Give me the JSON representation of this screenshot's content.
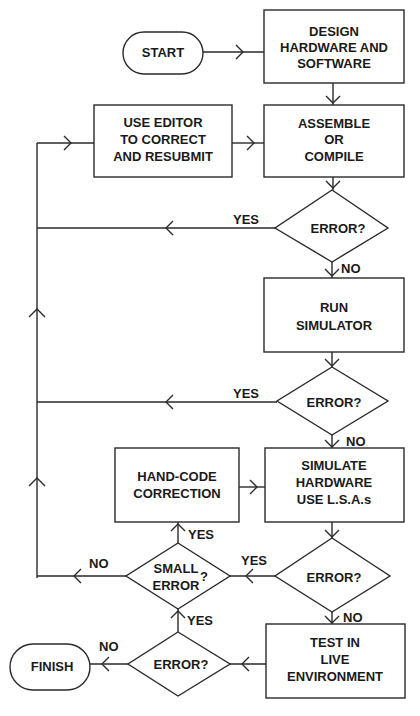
{
  "diagram": {
    "type": "flowchart",
    "nodes": {
      "start": {
        "label": "START",
        "shape": "terminator"
      },
      "design": {
        "lines": [
          "DESIGN",
          "HARDWARE AND",
          "SOFTWARE"
        ],
        "shape": "process"
      },
      "assemble": {
        "lines": [
          "ASSEMBLE",
          "OR",
          "COMPILE"
        ],
        "shape": "process"
      },
      "editor": {
        "lines": [
          "USE EDITOR",
          "TO CORRECT",
          "AND RESUBMIT"
        ],
        "shape": "process"
      },
      "error1": {
        "label": "ERROR?",
        "shape": "decision"
      },
      "run_sim": {
        "lines": [
          "RUN",
          "SIMULATOR"
        ],
        "shape": "process"
      },
      "error2": {
        "label": "ERROR?",
        "shape": "decision"
      },
      "simulate": {
        "lines": [
          "SIMULATE",
          "HARDWARE",
          "USE L.S.A.s"
        ],
        "shape": "process"
      },
      "handcode": {
        "lines": [
          "HAND-CODE",
          "CORRECTION"
        ],
        "shape": "process"
      },
      "error3": {
        "label": "ERROR?",
        "shape": "decision"
      },
      "small_error": {
        "lines": [
          "SMALL",
          "ERROR"
        ],
        "suffix": "?",
        "shape": "decision"
      },
      "test": {
        "lines": [
          "TEST IN",
          "LIVE",
          "ENVIRONMENT"
        ],
        "shape": "process"
      },
      "error4": {
        "label": "ERROR?",
        "shape": "decision"
      },
      "finish": {
        "label": "FINISH",
        "shape": "terminator"
      }
    },
    "edge_labels": {
      "error1_yes": "YES",
      "error1_no": "NO",
      "error2_yes": "YES",
      "error2_no": "NO",
      "error3_yes": "YES",
      "error3_no": "NO",
      "small_error_yes": "YES",
      "small_error_no": "NO",
      "error4_yes": "YES",
      "error4_no": "NO"
    },
    "edges": [
      [
        "start",
        "design"
      ],
      [
        "design",
        "assemble"
      ],
      [
        "editor",
        "assemble"
      ],
      [
        "assemble",
        "error1"
      ],
      [
        "error1",
        "editor",
        "YES"
      ],
      [
        "error1",
        "run_sim",
        "NO"
      ],
      [
        "run_sim",
        "error2"
      ],
      [
        "error2",
        "editor",
        "YES"
      ],
      [
        "error2",
        "simulate",
        "NO"
      ],
      [
        "simulate",
        "error3"
      ],
      [
        "error3",
        "small_error",
        "YES"
      ],
      [
        "error3",
        "test",
        "NO"
      ],
      [
        "small_error",
        "handcode",
        "YES"
      ],
      [
        "small_error",
        "editor",
        "NO"
      ],
      [
        "handcode",
        "simulate"
      ],
      [
        "test",
        "error4"
      ],
      [
        "error4",
        "small_error",
        "YES"
      ],
      [
        "error4",
        "finish",
        "NO"
      ]
    ]
  }
}
